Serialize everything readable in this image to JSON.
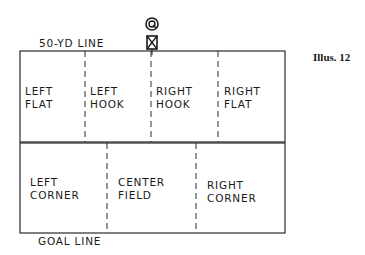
{
  "title_top": "50-YD LINE",
  "title_bottom": "GOAL LINE",
  "illustration_label": "Illus. 12",
  "icons": {
    "quarterback": "circle-q-icon",
    "center": "box-x-icon"
  },
  "zones": {
    "top": [
      {
        "line1": "LEFT",
        "line2": "FLAT"
      },
      {
        "line1": "LEFT",
        "line2": "HOOK"
      },
      {
        "line1": "RIGHT",
        "line2": "HOOK"
      },
      {
        "line1": "RIGHT",
        "line2": "FLAT"
      }
    ],
    "bottom": [
      {
        "line1": "LEFT",
        "line2": "CORNER"
      },
      {
        "line1": "CENTER",
        "line2": "FIELD"
      },
      {
        "line1": "RIGHT",
        "line2": "CORNER"
      }
    ]
  },
  "colors": {
    "line": "#2a2a2a",
    "background": "#ffffff"
  }
}
